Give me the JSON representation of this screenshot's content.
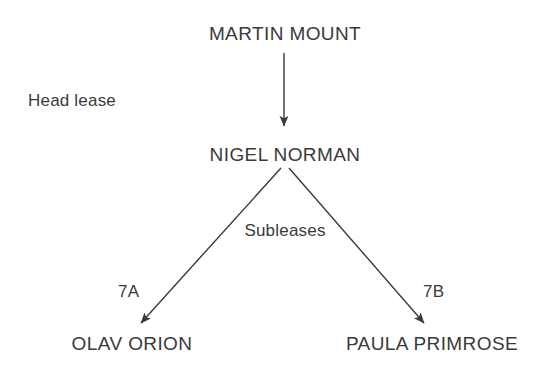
{
  "diagram": {
    "title_text": "",
    "background_color": "#ffffff",
    "ink_color": "#3a3a3a",
    "nodes": [
      {
        "id": "martin-mount",
        "label": "MARTIN MOUNT",
        "x": 285,
        "y": 24
      },
      {
        "id": "nigel-norman",
        "label": "NIGEL NORMAN",
        "x": 285,
        "y": 145
      },
      {
        "id": "olav-orion",
        "label": "OLAV ORION",
        "x": 132,
        "y": 334
      },
      {
        "id": "paula-primrose",
        "label": "PAULA PRIMROSE",
        "x": 432,
        "y": 334
      }
    ],
    "edge_labels": [
      {
        "id": "head-lease",
        "label": "Head lease",
        "x": 28,
        "y": 92,
        "align": "left"
      },
      {
        "id": "subleases",
        "label": "Subleases",
        "x": 285,
        "y": 222,
        "align": "center"
      },
      {
        "id": "lease-7a",
        "label": "7A",
        "x": 118,
        "y": 283,
        "align": "left"
      },
      {
        "id": "lease-7b",
        "label": "7B",
        "x": 423,
        "y": 283,
        "align": "left"
      }
    ],
    "edges": [
      {
        "id": "head-lease-arrow",
        "from": "martin-mount",
        "to": "nigel-norman",
        "x1": 284,
        "y1": 53,
        "x2": 284,
        "y2": 130
      },
      {
        "id": "sublease-7a-arrow",
        "from": "nigel-norman",
        "to": "olav-orion",
        "x1": 281,
        "y1": 168,
        "x2": 137,
        "y2": 327
      },
      {
        "id": "sublease-7b-arrow",
        "from": "nigel-norman",
        "to": "paula-primrose",
        "x1": 289,
        "y1": 168,
        "x2": 428,
        "y2": 327
      }
    ]
  }
}
